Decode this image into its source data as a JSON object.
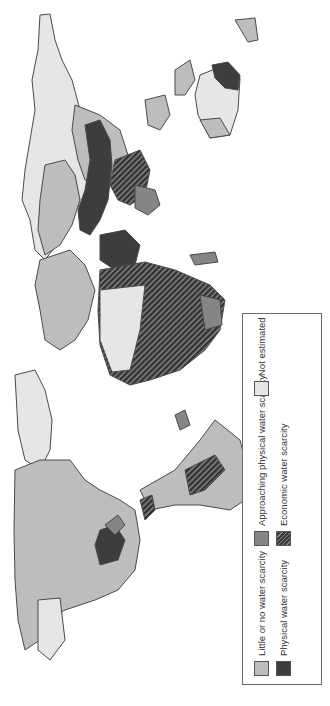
{
  "map": {
    "title": "World water scarcity",
    "orientation": "rotated 90 degrees counter-clockwise",
    "regions": [
      {
        "name": "North America",
        "dominant": "little_or_none"
      },
      {
        "name": "Greenland",
        "dominant": "not_estimated"
      },
      {
        "name": "South America",
        "dominant": "little_or_none"
      },
      {
        "name": "Europe",
        "dominant": "little_or_none"
      },
      {
        "name": "Africa",
        "dominant": "economic"
      },
      {
        "name": "Middle East / Central Asia",
        "dominant": "physical"
      },
      {
        "name": "Russia",
        "dominant": "little_or_none"
      },
      {
        "name": "South Asia",
        "dominant": "economic"
      },
      {
        "name": "Australia",
        "dominant": "not_estimated"
      }
    ]
  },
  "legend": {
    "items": [
      {
        "key": "little_or_none",
        "label": "Little or no water scarcity",
        "color": "#bdbdbd"
      },
      {
        "key": "approaching",
        "label": "Approaching physical water scarcity",
        "color": "#858585"
      },
      {
        "key": "not_estimated",
        "label": "Not estimated",
        "color": "#e6e6e6"
      },
      {
        "key": "physical",
        "label": "Physical water scarcity",
        "color": "#3d3d3d"
      },
      {
        "key": "economic",
        "label": "Economic water scarcity",
        "color": "#3a3a3a",
        "pattern": "hatched"
      }
    ]
  }
}
